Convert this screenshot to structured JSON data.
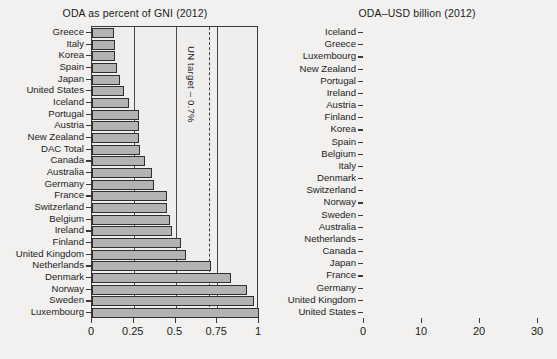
{
  "chart_data": [
    {
      "type": "bar",
      "orientation": "horizontal",
      "title": "ODA as percent of GNI (2012)",
      "xlabel": "",
      "ylabel": "",
      "xlim": [
        0,
        1
      ],
      "xticks": [
        0,
        0.25,
        0.5,
        0.75,
        1
      ],
      "xticklabels": [
        "0",
        "0.25",
        "0.5",
        "0.75",
        "1"
      ],
      "grid": true,
      "legend": "none",
      "annotations": [
        {
          "text": "UN target – 0.7%",
          "value": 0.7,
          "style": "dashed-vertical-line"
        }
      ],
      "categories": [
        "Greece",
        "Italy",
        "Korea",
        "Spain",
        "Japan",
        "United States",
        "Iceland",
        "Portugal",
        "Austria",
        "New Zealand",
        "DAC Total",
        "Canada",
        "Australia",
        "Germany",
        "France",
        "Switzerland",
        "Belgium",
        "Ireland",
        "Finland",
        "United Kingdom",
        "Netherlands",
        "Denmark",
        "Norway",
        "Sweden",
        "Luxembourg"
      ],
      "values": [
        0.13,
        0.14,
        0.14,
        0.15,
        0.17,
        0.19,
        0.22,
        0.28,
        0.28,
        0.28,
        0.29,
        0.32,
        0.36,
        0.37,
        0.45,
        0.45,
        0.47,
        0.48,
        0.53,
        0.56,
        0.71,
        0.83,
        0.93,
        0.97,
        1.0
      ]
    },
    {
      "type": "bar",
      "orientation": "horizontal",
      "title": "ODA–USD billion (2012)",
      "xlabel": "",
      "ylabel": "",
      "xlim": [
        0,
        30
      ],
      "xticks": [
        0,
        10,
        20,
        30
      ],
      "xticklabels": [
        "0",
        "10",
        "20",
        "30"
      ],
      "grid": true,
      "legend": "none",
      "categories": [
        "Iceland",
        "Greece",
        "Luxembourg",
        "New Zealand",
        "Portugal",
        "Ireland",
        "Austria",
        "Finland",
        "Korea",
        "Spain",
        "Belgium",
        "Italy",
        "Denmark",
        "Switzerland",
        "Norway",
        "Sweden",
        "Australia",
        "Netherlands",
        "Canada",
        "Japan",
        "France",
        "Germany",
        "United Kingdom",
        "United States"
      ],
      "values": [
        0.03,
        0.32,
        0.43,
        0.46,
        0.58,
        0.81,
        1.11,
        1.32,
        1.6,
        2.04,
        2.32,
        2.64,
        2.7,
        3.06,
        4.75,
        5.24,
        5.44,
        5.52,
        5.68,
        10.6,
        12.1,
        13.0,
        13.9,
        30.5
      ]
    }
  ]
}
